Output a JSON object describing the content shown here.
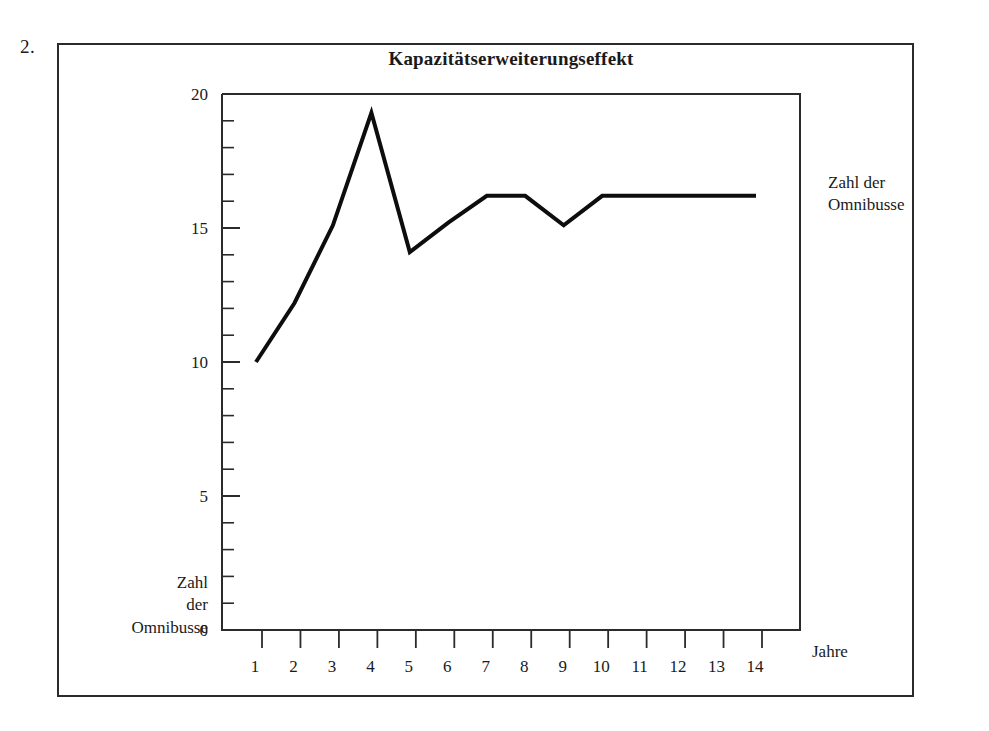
{
  "figure": {
    "number_label": "2.",
    "title": "Kapazitätserweiterungseffekt"
  },
  "labels": {
    "y_axis_right": "Zahl der\nOmnibusse",
    "y_axis_left": "Zahl\nder\nOmnibusse",
    "x_axis": "Jahre"
  },
  "colors": {
    "line": "#0d0d0d",
    "axis": "#2b2b2b",
    "frame": "#2b2b2b",
    "text": "#1a1a1a",
    "background": "#ffffff"
  },
  "chart_data": {
    "type": "line",
    "title": "Kapazitätserweiterungseffekt",
    "xlabel": "Jahre",
    "ylabel": "Zahl der Omnibusse",
    "x": [
      1,
      2,
      3,
      4,
      5,
      6,
      7,
      8,
      9,
      10,
      11,
      12,
      13,
      14
    ],
    "values": [
      10.0,
      12.2,
      15.1,
      19.3,
      14.1,
      15.2,
      16.2,
      16.2,
      15.1,
      16.2,
      16.2,
      16.2,
      16.2,
      16.2
    ],
    "series": [
      {
        "name": "Zahl der Omnibusse",
        "values": [
          10.0,
          12.2,
          15.1,
          19.3,
          14.1,
          15.2,
          16.2,
          16.2,
          15.1,
          16.2,
          16.2,
          16.2,
          16.2,
          16.2
        ]
      }
    ],
    "x_tick_labels": [
      "1",
      "2",
      "3",
      "4",
      "5",
      "6",
      "7",
      "8",
      "9",
      "10",
      "11",
      "12",
      "13",
      "14"
    ],
    "y_tick_labels": [
      "0",
      "5",
      "10",
      "15",
      "20"
    ],
    "y_major_ticks": [
      0,
      5,
      10,
      15,
      20
    ],
    "y_minor_tick_step": 1,
    "xlim": [
      0.85,
      14.15
    ],
    "ylim": [
      0,
      20
    ],
    "grid": false,
    "legend": false,
    "markers": false
  }
}
